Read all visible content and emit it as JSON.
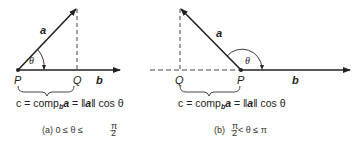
{
  "figure": {
    "panels": [
      {
        "id": "a",
        "labels": {
          "vector_a": "a",
          "vector_b": "b",
          "point_p": "P",
          "point_q": "Q",
          "angle": "θ"
        },
        "formula": {
          "lhs": "c = comp",
          "sub": "b",
          "vec": "a",
          "eq": " = ",
          "norm_open": "‖",
          "norm_vec": "a",
          "norm_close": "‖",
          "tail": " cos θ"
        },
        "caption": {
          "prefix": "(a) 0 ≤ θ ≤ ",
          "frac_num": "π",
          "frac_den": "2"
        }
      },
      {
        "id": "b",
        "labels": {
          "vector_a": "a",
          "vector_b": "b",
          "point_p": "P",
          "point_q": "Q",
          "angle": "θ"
        },
        "formula": {
          "lhs": "c = comp",
          "sub": "b",
          "vec": "a",
          "eq": " = ",
          "norm_open": "‖",
          "norm_vec": "a",
          "norm_close": "‖",
          "tail": " cos θ"
        },
        "caption": {
          "prefix": "(b) ",
          "frac_num": "π",
          "frac_den": "2",
          "suffix": " < θ ≤ π"
        }
      }
    ]
  }
}
